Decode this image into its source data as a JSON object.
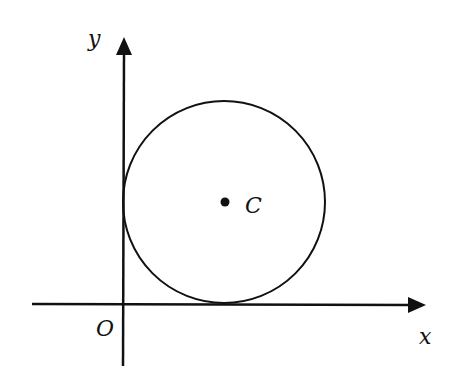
{
  "diagram": {
    "type": "coordinate-geometry",
    "axes": {
      "x_label": "x",
      "y_label": "y",
      "origin_label": "O"
    },
    "circle": {
      "center_label": "C",
      "tangent_to": [
        "x-axis",
        "y-axis"
      ]
    },
    "colors": {
      "stroke": "#111111",
      "background": "#ffffff"
    }
  }
}
